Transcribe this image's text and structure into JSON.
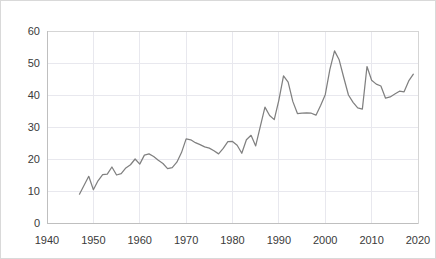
{
  "chart_data": {
    "type": "line",
    "title": "",
    "subtitle": "",
    "xlabel": "",
    "ylabel": "",
    "xlim": [
      1940,
      2020
    ],
    "ylim": [
      0,
      60
    ],
    "grid": true,
    "legend": false,
    "legend_position": "none",
    "line_color": "#808080",
    "grid_color": "#e8e8ee",
    "axis_color": "#bfbfbf",
    "background_color": "#ffffff",
    "x_ticks": [
      1940,
      1950,
      1960,
      1970,
      1980,
      1990,
      2000,
      2010,
      2020
    ],
    "y_ticks": [
      0,
      10,
      20,
      30,
      40,
      50,
      60
    ],
    "x_tick_labels": [
      "1940",
      "1950",
      "1960",
      "1970",
      "1980",
      "1990",
      "2000",
      "2010",
      "2020"
    ],
    "y_tick_labels": [
      "0",
      "10",
      "20",
      "30",
      "40",
      "50",
      "60"
    ],
    "series": [
      {
        "name": "series-1",
        "x": [
          1947,
          1948,
          1949,
          1950,
          1951,
          1952,
          1953,
          1954,
          1955,
          1956,
          1957,
          1958,
          1959,
          1960,
          1961,
          1962,
          1963,
          1964,
          1965,
          1966,
          1967,
          1968,
          1969,
          1970,
          1971,
          1972,
          1973,
          1974,
          1975,
          1976,
          1977,
          1978,
          1979,
          1980,
          1981,
          1982,
          1983,
          1984,
          1985,
          1986,
          1987,
          1988,
          1989,
          1990,
          1991,
          1992,
          1993,
          1994,
          1995,
          1996,
          1997,
          1998,
          1999,
          2000,
          2001,
          2002,
          2003,
          2004,
          2005,
          2006,
          2007,
          2008,
          2009,
          2010,
          2011,
          2012,
          2013,
          2014,
          2015,
          2016,
          2017,
          2018,
          2019
        ],
        "y": [
          9.0,
          11.8,
          14.6,
          10.4,
          13.2,
          15.1,
          15.3,
          17.5,
          15.0,
          15.4,
          17.2,
          18.2,
          20.0,
          18.4,
          21.2,
          21.6,
          20.8,
          19.6,
          18.6,
          17.0,
          17.3,
          19.0,
          22.0,
          26.3,
          26.0,
          25.1,
          24.5,
          23.8,
          23.4,
          22.6,
          21.6,
          23.3,
          25.4,
          25.5,
          24.3,
          21.8,
          26.0,
          27.4,
          24.1,
          30.2,
          36.2,
          33.6,
          32.3,
          38.4,
          46.0,
          44.0,
          38.0,
          34.2,
          34.3,
          34.4,
          34.3,
          33.7,
          36.7,
          40.1,
          48.0,
          53.8,
          51.0,
          45.4,
          40.0,
          37.7,
          36.0,
          35.6,
          48.9,
          44.6,
          43.4,
          42.8,
          39.0,
          39.4,
          40.3,
          41.2,
          41.0,
          44.4,
          46.5
        ]
      }
    ]
  },
  "axes": {
    "y_axis_label_top": "60",
    "x_axis_label_left": "1940",
    "x_axis_label_right": "2020"
  }
}
